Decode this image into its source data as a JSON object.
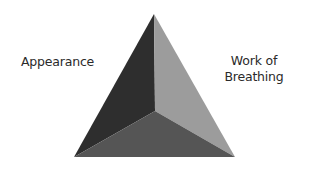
{
  "diagram": {
    "type": "assessment-triangle",
    "labels": {
      "left": "Appearance",
      "right_line1": "Work of",
      "right_line2": "Breathing",
      "bottom": ""
    },
    "faces": {
      "left_color": "#2e2e2e",
      "right_color": "#9c9c9c",
      "bottom_color": "#555555"
    }
  }
}
